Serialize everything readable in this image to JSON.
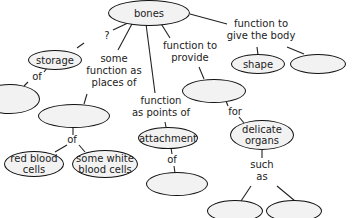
{
  "diagram": {
    "type": "concept-map",
    "nodes": {
      "bones": "bones",
      "storage": "storage",
      "storage_of_blank": "",
      "places_blank": "",
      "red_blood_cells": "red blood cells",
      "white_blood_cells": "some white blood cells",
      "attachment": "attachment",
      "attachment_of_blank": "",
      "provide_blank": "",
      "delicate_organs": "delicate organs",
      "organ_example_1": "",
      "organ_example_2": "",
      "shape": "shape",
      "shape_blank": ""
    },
    "labels": {
      "question": "?",
      "of_storage": "of",
      "places_of_line1": "some",
      "places_of_line2": "function as",
      "places_of_line3": "places of",
      "of_cells": "of",
      "points_of_line1": "function",
      "points_of_line2": "as points of",
      "of_attachment": "of",
      "provide_line1": "function to",
      "provide_line2": "provide",
      "for": "for",
      "such_as_line1": "such",
      "such_as_line2": "as",
      "give_line1": "function to",
      "give_line2": "give the body"
    }
  }
}
